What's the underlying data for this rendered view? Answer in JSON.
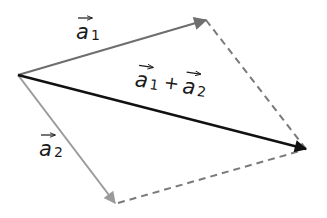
{
  "diagram": {
    "type": "vector-addition-parallelogram",
    "origin": [
      18,
      75
    ],
    "vectors": [
      {
        "name": "a1",
        "label": "a",
        "subscript": "1",
        "tip": [
          206,
          20
        ],
        "color": "#6e6e6e"
      },
      {
        "name": "a2",
        "label": "a",
        "subscript": "2",
        "tip": [
          115,
          203
        ],
        "color": "#9a9a9a"
      },
      {
        "name": "sum",
        "label_a": "a",
        "sub1": "1",
        "plus": "+",
        "label_b": "a",
        "sub2": "2",
        "tip": [
          306,
          149
        ],
        "color": "#111111"
      }
    ],
    "dashed_color": "#7a7a7a"
  }
}
